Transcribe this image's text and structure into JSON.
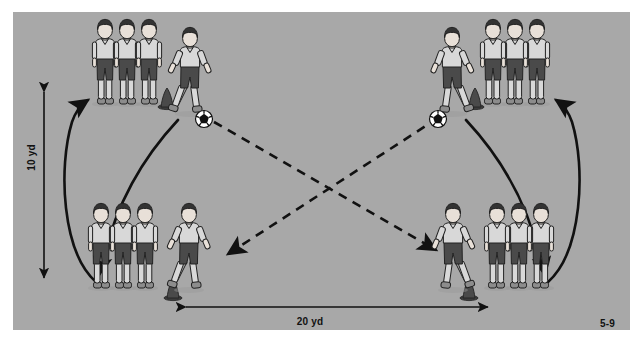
{
  "figure": {
    "number": "5-9",
    "background_color": "#a8a8a8",
    "page_color": "#ffffff",
    "ink_color": "#111111"
  },
  "dimensions": {
    "vertical_label": "10 yd",
    "horizontal_label": "20 yd",
    "vertical_value": 10,
    "horizontal_value": 20,
    "unit": "yd"
  },
  "legend": {
    "pass_line_style": "dashed",
    "run_line_style": "solid-curved",
    "cone_icon": "cone-icon",
    "ball_icon": "soccer-ball-icon"
  },
  "groups": [
    {
      "id": "top-left",
      "name": "Top left group",
      "queue_count": 3,
      "active_player_jersey": "#d8d8d8",
      "has_ball": true,
      "cone": true
    },
    {
      "id": "top-right",
      "name": "Top right group",
      "queue_count": 3,
      "active_player_jersey": "#d8d8d8",
      "has_ball": true,
      "cone": true
    },
    {
      "id": "bottom-left",
      "name": "Bottom left group",
      "queue_count": 3,
      "active_player_jersey": "#ffffff",
      "has_ball": false,
      "cone": true
    },
    {
      "id": "bottom-right",
      "name": "Bottom right group",
      "queue_count": 3,
      "active_player_jersey": "#ffffff",
      "has_ball": false,
      "cone": true
    }
  ],
  "passes": [
    {
      "id": "pass-tl-to-br",
      "from": "top-left",
      "to": "bottom-right",
      "style": "dashed"
    },
    {
      "id": "pass-tr-to-bl",
      "from": "top-right",
      "to": "bottom-left",
      "style": "dashed"
    }
  ],
  "runs": [
    {
      "id": "run-left-up",
      "direction": "up",
      "side": "left"
    },
    {
      "id": "run-left-down",
      "direction": "down",
      "side": "left"
    },
    {
      "id": "run-right-up",
      "direction": "up",
      "side": "right"
    },
    {
      "id": "run-right-down",
      "direction": "down",
      "side": "right"
    }
  ],
  "colors": {
    "jersey_light": "#d8d8d8",
    "jersey_white": "#ffffff",
    "shorts_dark": "#4a4a4a",
    "skin_light": "#e8e0d8",
    "skin_dark": "#8a7a6a",
    "hair_dark": "#333333",
    "sock_light": "#d8d8d8",
    "shoe": "#8c8c8c",
    "cone": "#3c3c3c",
    "outline": "#222222"
  }
}
